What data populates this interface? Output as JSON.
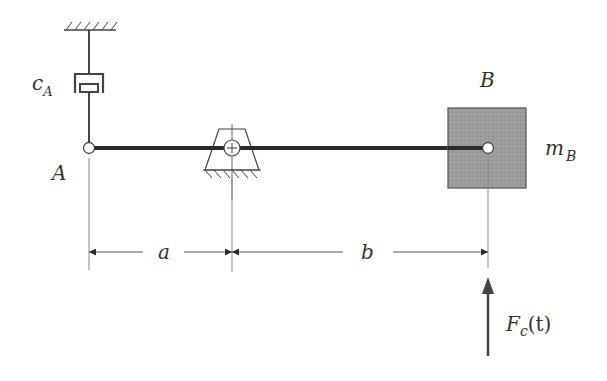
{
  "diagram": {
    "type": "mechanical-system",
    "colors": {
      "line": "#444444",
      "bar": "#2a2a2a",
      "mass_fill": "#9a9a9a",
      "mass_border": "#555555",
      "thin_line": "#777777"
    },
    "labels": {
      "damper": "c",
      "damper_sub": "A",
      "point_a": "A",
      "point_b": "B",
      "mass": "m",
      "mass_sub": "B",
      "dim_a": "a",
      "dim_b": "b",
      "force": "F",
      "force_sub": "c",
      "force_arg": "(t)"
    },
    "components": [
      {
        "id": "ground-top",
        "kind": "fixed-ground",
        "position": "above damper"
      },
      {
        "id": "damper-cA",
        "kind": "viscous-damper",
        "connects": [
          "ground-top",
          "A"
        ]
      },
      {
        "id": "bar",
        "kind": "rigid-bar",
        "from": "A",
        "to": "B"
      },
      {
        "id": "pivot",
        "kind": "pin-support",
        "distance_from_A": "a"
      },
      {
        "id": "mass-mB",
        "kind": "point-mass",
        "at": "B"
      },
      {
        "id": "force-Fc",
        "kind": "applied-force",
        "at": "B",
        "direction": "up"
      }
    ],
    "dimensions": [
      {
        "label": "a",
        "from": "A",
        "to": "pivot"
      },
      {
        "label": "b",
        "from": "pivot",
        "to": "B"
      }
    ]
  }
}
